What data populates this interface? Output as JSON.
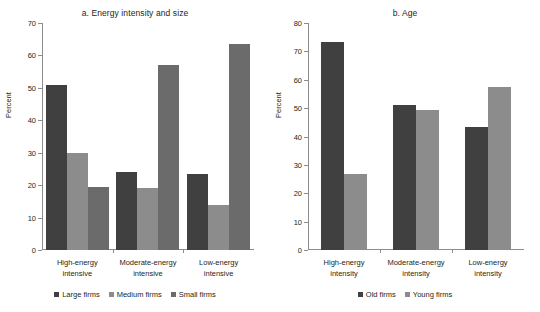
{
  "chart_data": [
    {
      "type": "bar",
      "title": "a. Energy intensity and size",
      "xlabel": "",
      "ylabel": "Percent",
      "ylim": [
        0,
        70
      ],
      "yticks": [
        0,
        10,
        20,
        30,
        40,
        50,
        60,
        70
      ],
      "grid": false,
      "legend_position": "bottom",
      "categories": [
        "High-energy intensive",
        "Moderate-energy intensive",
        "Low-energy intensive"
      ],
      "categories_lines": [
        [
          "High-energy",
          "intensive"
        ],
        [
          "Moderate-energy",
          "intensive"
        ],
        [
          "Low-energy",
          "intensive"
        ]
      ],
      "series": [
        {
          "name": "Large firms",
          "color": "#404040",
          "values": [
            50.8,
            24.0,
            23.5
          ]
        },
        {
          "name": "Medium firms",
          "color": "#8c8c8c",
          "values": [
            29.8,
            19.1,
            13.8
          ]
        },
        {
          "name": "Small firms",
          "color": "#6b6b6b",
          "values": [
            19.4,
            57.2,
            63.5
          ]
        }
      ]
    },
    {
      "type": "bar",
      "title": "b. Age",
      "xlabel": "",
      "ylabel": "Percent",
      "ylim": [
        0,
        80
      ],
      "yticks": [
        0,
        10,
        20,
        30,
        40,
        50,
        60,
        70,
        80
      ],
      "grid": false,
      "legend_position": "bottom",
      "categories": [
        "High-energy intensity",
        "Moderate-energy intensity",
        "Low-energy intensity"
      ],
      "categories_lines": [
        [
          "High-energy",
          "intensity"
        ],
        [
          "Moderate-energy",
          "intensity"
        ],
        [
          "Low-energy",
          "intensity"
        ]
      ],
      "series": [
        {
          "name": "Old firms",
          "color": "#404040",
          "values": [
            73.3,
            51.0,
            43.3
          ]
        },
        {
          "name": "Young firms",
          "color": "#8c8c8c",
          "values": [
            26.8,
            49.3,
            57.3
          ]
        }
      ]
    }
  ]
}
